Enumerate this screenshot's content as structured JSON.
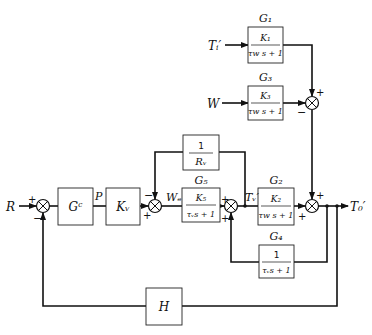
{
  "diagram": {
    "type": "block-diagram",
    "inputs": {
      "R": "R",
      "Ti": "Tᵢ′",
      "W": "W"
    },
    "output": "T₀′",
    "signals": {
      "P": "P",
      "We": "Wₑ",
      "Tv": "Tᵥ′"
    },
    "blocks": {
      "Gc": {
        "label": "Gᶜ",
        "content": "Gᶜ"
      },
      "Kv": {
        "label": "Kᵥ",
        "content": "Kᵥ"
      },
      "Rv": {
        "num": "1",
        "den": "Rᵥ"
      },
      "G5": {
        "title": "G₅",
        "num": "K₅",
        "den": "τᵥs + 1"
      },
      "G2": {
        "title": "G₂",
        "num": "K₂",
        "den": "τw s + 1"
      },
      "G4": {
        "title": "G₄",
        "num": "1",
        "den": "τᵥs + 1"
      },
      "G1": {
        "title": "G₁",
        "num": "K₁",
        "den": "τw s + 1"
      },
      "G3": {
        "title": "G₃",
        "num": "K₃",
        "den": "τw s + 1"
      },
      "H": {
        "content": "H"
      }
    },
    "signs": {
      "plus": "+",
      "minus": "−"
    }
  }
}
